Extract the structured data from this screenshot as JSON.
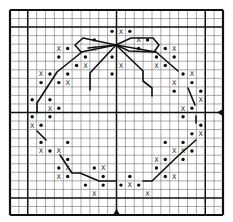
{
  "pattern": {
    "title": "Wreath with bow cross-stitch chart",
    "grid": {
      "cols": 24,
      "rows": 24,
      "origin_x": 10,
      "origin_y": 10,
      "width": 213,
      "height": 205,
      "bold_cols": [
        0,
        2,
        12,
        22,
        24
      ],
      "bold_rows": [
        0,
        2,
        12,
        22,
        24
      ],
      "line_color": "#555555",
      "bold_color": "#111111"
    },
    "symbols": {
      "dot": "•",
      "cross": "X"
    },
    "center_markers": [
      {
        "name": "right-center-arrow",
        "side": "right",
        "row_line": 12,
        "glyph": "◀"
      },
      {
        "name": "bottom-center-arrow",
        "side": "bottom",
        "col_line": 12,
        "glyph": "▲"
      }
    ],
    "cells": [
      {
        "r": 2,
        "c": 11,
        "s": "dot"
      },
      {
        "r": 2,
        "c": 12,
        "s": "cross"
      },
      {
        "r": 2,
        "c": 13,
        "s": "dot"
      },
      {
        "r": 3,
        "c": 9,
        "s": "dot"
      },
      {
        "r": 3,
        "c": 14,
        "s": "cross"
      },
      {
        "r": 3,
        "c": 15,
        "s": "dot"
      },
      {
        "r": 4,
        "c": 5,
        "s": "cross"
      },
      {
        "r": 4,
        "c": 6,
        "s": "dot"
      },
      {
        "r": 4,
        "c": 9,
        "s": "cross"
      },
      {
        "r": 4,
        "c": 14,
        "s": "dot"
      },
      {
        "r": 4,
        "c": 17,
        "s": "dot"
      },
      {
        "r": 4,
        "c": 18,
        "s": "cross"
      },
      {
        "r": 5,
        "c": 5,
        "s": "dot"
      },
      {
        "r": 5,
        "c": 8,
        "s": "dot"
      },
      {
        "r": 5,
        "c": 11,
        "s": "dot"
      },
      {
        "r": 5,
        "c": 16,
        "s": "dot"
      },
      {
        "r": 5,
        "c": 18,
        "s": "dot"
      },
      {
        "r": 6,
        "c": 7,
        "s": "dot"
      },
      {
        "r": 6,
        "c": 8,
        "s": "cross"
      },
      {
        "r": 6,
        "c": 12,
        "s": "cross"
      },
      {
        "r": 6,
        "c": 16,
        "s": "cross"
      },
      {
        "r": 6,
        "c": 17,
        "s": "dot"
      },
      {
        "r": 7,
        "c": 3,
        "s": "cross"
      },
      {
        "r": 7,
        "c": 4,
        "s": "dot"
      },
      {
        "r": 7,
        "c": 6,
        "s": "dot"
      },
      {
        "r": 7,
        "c": 11,
        "s": "dot"
      },
      {
        "r": 7,
        "c": 19,
        "s": "dot"
      },
      {
        "r": 7,
        "c": 20,
        "s": "cross"
      },
      {
        "r": 8,
        "c": 3,
        "s": "dot"
      },
      {
        "r": 8,
        "c": 5,
        "s": "dot"
      },
      {
        "r": 8,
        "c": 6,
        "s": "cross"
      },
      {
        "r": 8,
        "c": 18,
        "s": "cross"
      },
      {
        "r": 8,
        "c": 20,
        "s": "dot"
      },
      {
        "r": 9,
        "c": 18,
        "s": "dot"
      },
      {
        "r": 9,
        "c": 21,
        "s": "dot"
      },
      {
        "r": 10,
        "c": 2,
        "s": "dot"
      },
      {
        "r": 10,
        "c": 4,
        "s": "dot"
      },
      {
        "r": 10,
        "c": 21,
        "s": "cross"
      },
      {
        "r": 11,
        "c": 4,
        "s": "cross"
      },
      {
        "r": 11,
        "c": 5,
        "s": "dot"
      },
      {
        "r": 11,
        "c": 19,
        "s": "cross"
      },
      {
        "r": 11,
        "c": 20,
        "s": "dot"
      },
      {
        "r": 12,
        "c": 2,
        "s": "dot"
      },
      {
        "r": 12,
        "c": 4,
        "s": "dot"
      },
      {
        "r": 12,
        "c": 19,
        "s": "dot"
      },
      {
        "r": 13,
        "c": 2,
        "s": "cross"
      },
      {
        "r": 13,
        "c": 3,
        "s": "dot"
      },
      {
        "r": 13,
        "c": 21,
        "s": "dot"
      },
      {
        "r": 14,
        "c": 20,
        "s": "dot"
      },
      {
        "r": 14,
        "c": 21,
        "s": "cross"
      },
      {
        "r": 15,
        "c": 3,
        "s": "dot"
      },
      {
        "r": 15,
        "c": 6,
        "s": "dot"
      },
      {
        "r": 15,
        "c": 17,
        "s": "dot"
      },
      {
        "r": 15,
        "c": 19,
        "s": "dot"
      },
      {
        "r": 16,
        "c": 3,
        "s": "cross"
      },
      {
        "r": 16,
        "c": 4,
        "s": "dot"
      },
      {
        "r": 16,
        "c": 5,
        "s": "cross"
      },
      {
        "r": 16,
        "c": 18,
        "s": "cross"
      },
      {
        "r": 16,
        "c": 19,
        "s": "cross"
      },
      {
        "r": 16,
        "c": 20,
        "s": "dot"
      },
      {
        "r": 17,
        "c": 6,
        "s": "dot"
      },
      {
        "r": 17,
        "c": 16,
        "s": "cross"
      },
      {
        "r": 17,
        "c": 17,
        "s": "dot"
      },
      {
        "r": 17,
        "c": 19,
        "s": "dot"
      },
      {
        "r": 18,
        "c": 5,
        "s": "dot"
      },
      {
        "r": 18,
        "c": 6,
        "s": "cross"
      },
      {
        "r": 18,
        "c": 9,
        "s": "dot"
      },
      {
        "r": 18,
        "c": 10,
        "s": "cross"
      },
      {
        "r": 18,
        "c": 16,
        "s": "dot"
      },
      {
        "r": 19,
        "c": 5,
        "s": "cross"
      },
      {
        "r": 19,
        "c": 6,
        "s": "dot"
      },
      {
        "r": 19,
        "c": 10,
        "s": "dot"
      },
      {
        "r": 19,
        "c": 13,
        "s": "dot"
      },
      {
        "r": 19,
        "c": 17,
        "s": "dot"
      },
      {
        "r": 19,
        "c": 18,
        "s": "cross"
      },
      {
        "r": 20,
        "c": 8,
        "s": "dot"
      },
      {
        "r": 20,
        "c": 10,
        "s": "dot"
      },
      {
        "r": 20,
        "c": 12,
        "s": "dot"
      },
      {
        "r": 20,
        "c": 13,
        "s": "cross"
      },
      {
        "r": 20,
        "c": 14,
        "s": "dot"
      },
      {
        "r": 21,
        "c": 9,
        "s": "cross"
      },
      {
        "r": 21,
        "c": 15,
        "s": "cross"
      }
    ],
    "backstitch": [
      {
        "name": "bow-left-loop",
        "points": [
          [
            116,
            45
          ],
          [
            83,
            38
          ],
          [
            75,
            45
          ],
          [
            81,
            52
          ],
          [
            116,
            45
          ]
        ]
      },
      {
        "name": "bow-left-inner",
        "points": [
          [
            116,
            45
          ],
          [
            88,
            48
          ]
        ]
      },
      {
        "name": "bow-right-loop",
        "points": [
          [
            116,
            45
          ],
          [
            131,
            38
          ],
          [
            153,
            38
          ],
          [
            159,
            45
          ],
          [
            154,
            52
          ],
          [
            129,
            51
          ],
          [
            116,
            45
          ]
        ]
      },
      {
        "name": "bow-right-inner",
        "points": [
          [
            116,
            45
          ],
          [
            156,
            52
          ]
        ]
      },
      {
        "name": "left-streamer",
        "points": [
          [
            116,
            45
          ],
          [
            90,
            73
          ],
          [
            90,
            90
          ]
        ]
      },
      {
        "name": "right-streamer",
        "points": [
          [
            116,
            45
          ],
          [
            143,
            71
          ],
          [
            143,
            81
          ],
          [
            152,
            88
          ],
          [
            152,
            96
          ]
        ]
      },
      {
        "name": "wreath-upper-left",
        "points": [
          [
            82,
            52
          ],
          [
            57,
            72
          ],
          [
            37,
            103
          ],
          [
            37,
            113
          ]
        ]
      },
      {
        "name": "wreath-upper-right",
        "points": [
          [
            156,
            52
          ],
          [
            178,
            71
          ]
        ]
      },
      {
        "name": "wreath-right-mid",
        "points": [
          [
            188,
            88
          ],
          [
            195,
            105
          ]
        ]
      },
      {
        "name": "wreath-right-low",
        "points": [
          [
            196,
            116
          ],
          [
            196,
            123
          ]
        ]
      },
      {
        "name": "wreath-left-low",
        "points": [
          [
            37,
            131
          ],
          [
            46,
            140
          ]
        ]
      },
      {
        "name": "wreath-bottom-left",
        "points": [
          [
            60,
            155
          ],
          [
            72,
            173
          ],
          [
            80,
            173
          ],
          [
            99,
            181
          ],
          [
            116,
            181
          ]
        ]
      },
      {
        "name": "wreath-bottom-right",
        "points": [
          [
            196,
            140
          ],
          [
            178,
            156
          ],
          [
            152,
            181
          ],
          [
            143,
            181
          ]
        ]
      }
    ]
  }
}
